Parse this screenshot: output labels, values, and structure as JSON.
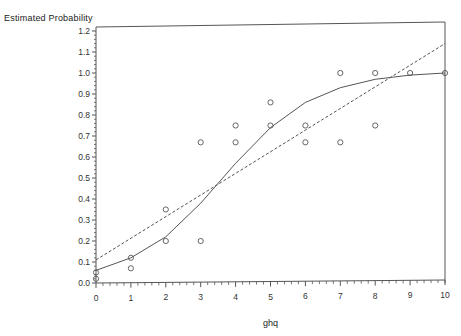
{
  "chart_data": {
    "type": "scatter",
    "title": "",
    "xlabel": "ghq",
    "ylabel": "Estimated Probability",
    "xlim": [
      0,
      10
    ],
    "ylim": [
      0.0,
      1.2
    ],
    "x_ticks": [
      "0",
      "1",
      "2",
      "3",
      "4",
      "5",
      "6",
      "7",
      "8",
      "9",
      "10"
    ],
    "y_ticks": [
      "0.0",
      "0.1",
      "0.2",
      "0.3",
      "0.4",
      "0.5",
      "0.6",
      "0.7",
      "0.8",
      "0.9",
      "1.0",
      "1.1",
      "1.2"
    ],
    "grid": false,
    "legend": null,
    "series": [
      {
        "name": "observed",
        "kind": "scatter",
        "marker": "open-circle",
        "points": [
          [
            0,
            0.05
          ],
          [
            0,
            0.02
          ],
          [
            1,
            0.12
          ],
          [
            1,
            0.07
          ],
          [
            2,
            0.35
          ],
          [
            2,
            0.2
          ],
          [
            3,
            0.67
          ],
          [
            3,
            0.2
          ],
          [
            4,
            0.75
          ],
          [
            4,
            0.67
          ],
          [
            5,
            0.86
          ],
          [
            5,
            0.75
          ],
          [
            6,
            0.75
          ],
          [
            6,
            0.67
          ],
          [
            7,
            1.0
          ],
          [
            7,
            0.67
          ],
          [
            8,
            1.0
          ],
          [
            8,
            0.75
          ],
          [
            9,
            1.0
          ],
          [
            10,
            1.0
          ]
        ]
      },
      {
        "name": "logistic fit",
        "kind": "line",
        "style": "solid",
        "x": [
          0,
          1,
          2,
          3,
          4,
          5,
          6,
          7,
          8,
          9,
          10
        ],
        "values": [
          0.06,
          0.12,
          0.22,
          0.38,
          0.57,
          0.74,
          0.86,
          0.93,
          0.97,
          0.99,
          1.0
        ]
      },
      {
        "name": "linear fit",
        "kind": "line",
        "style": "dashed",
        "x": [
          0,
          10
        ],
        "values": [
          0.11,
          1.14
        ]
      }
    ],
    "colors": {
      "axis": "#555555",
      "line": "#555555",
      "marker": "#555555"
    }
  }
}
